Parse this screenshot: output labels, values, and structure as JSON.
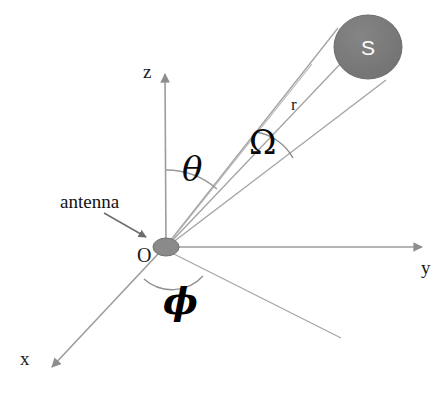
{
  "figure": {
    "background_color": "#ffffff",
    "line_color": "#9a9a9a",
    "axis_arrow_color": "#8e8e8e",
    "shape_fill": "#787878",
    "text_color": "#111111"
  },
  "axes": [
    {
      "id": "z",
      "label": "z",
      "direction": "up",
      "tip": {
        "x": 165,
        "y": 68
      },
      "label_pos": {
        "x": 143,
        "y": 62
      }
    },
    {
      "id": "y",
      "label": "y",
      "direction": "right",
      "tip": {
        "x": 428,
        "y": 247
      },
      "label_pos": {
        "x": 421,
        "y": 258
      }
    },
    {
      "id": "x",
      "label": "x",
      "direction": "down-left",
      "tip": {
        "x": 47,
        "y": 371
      },
      "label_pos": {
        "x": 20,
        "y": 349
      }
    }
  ],
  "origin": {
    "label": "O",
    "label_pos": {
      "x": 137,
      "y": 245
    },
    "point": {
      "x": 166,
      "y": 247
    },
    "marker": "filled-ellipse",
    "marker_rx": 13,
    "marker_ry": 9,
    "marker_fill": "#8a8a8a"
  },
  "annotations": {
    "antenna": {
      "label": "antenna",
      "label_pos": {
        "x": 60,
        "y": 192
      },
      "arrow_from": {
        "x": 104,
        "y": 214
      },
      "arrow_to": {
        "x": 148,
        "y": 238
      }
    },
    "range": {
      "label": "r",
      "label_pos": {
        "x": 291,
        "y": 96
      },
      "description": "distance from origin O to source S"
    },
    "polar_angle": {
      "label": "θ",
      "label_pos": {
        "x": 182,
        "y": 152
      },
      "description": "angle from z-axis to the line OS"
    },
    "azimuth_angle": {
      "label": "ϕ",
      "label_pos": {
        "x": 163,
        "y": 283
      },
      "description": "angle in the xy-plane measured from the x-axis"
    },
    "solid_angle": {
      "label": "Ω",
      "label_pos": {
        "x": 249,
        "y": 126
      },
      "description": "solid angle subtended by the source S at the origin"
    }
  },
  "source": {
    "label": "S",
    "center": {
      "x": 368,
      "y": 47
    },
    "rx": 34,
    "ry": 32,
    "fill": "#767676",
    "label_color": "#ffffff",
    "label_pos": {
      "x": 361,
      "y": 36
    }
  }
}
